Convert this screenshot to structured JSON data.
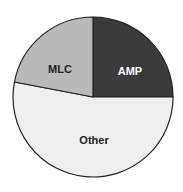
{
  "chart_data": {
    "type": "pie",
    "title": "",
    "start_angle_deg": 90,
    "direction": "clockwise",
    "slices": [
      {
        "label": "AMP",
        "value": 25,
        "color": "#3b3b3b",
        "text_color": "#ffffff",
        "label_pos": [
          130,
          75
        ]
      },
      {
        "label": "Other",
        "value": 53,
        "color": "#efefef",
        "text_color": "#222222",
        "label_pos": [
          94,
          144
        ]
      },
      {
        "label": "MLC",
        "value": 22,
        "color": "#b9b9b9",
        "text_color": "#222222",
        "label_pos": [
          60,
          73
        ]
      }
    ],
    "legend": "none",
    "center": [
      93,
      97
    ],
    "radius": 80,
    "stroke_color": "#222222"
  }
}
